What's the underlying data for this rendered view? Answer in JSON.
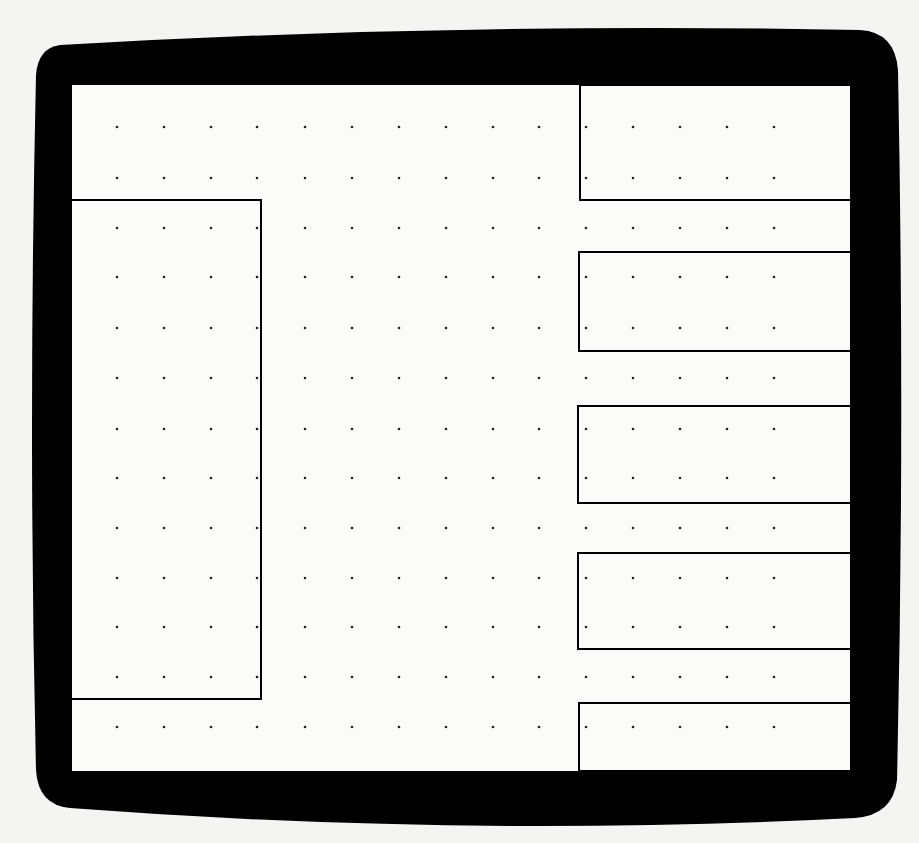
{
  "diagram": {
    "type": "dot-grid-with-rectangles",
    "frame": {
      "shape": "rounded-screen-bezel",
      "bezel_color": "#000000",
      "screen_color": "#fbfbf9",
      "background_color": "#f4f4f2",
      "screen_rect": {
        "x": 72,
        "y": 85,
        "w": 778,
        "h": 686
      }
    },
    "grid": {
      "dot_color": "#222222",
      "dot_radius": 1.3,
      "columns_x": [
        117,
        164,
        211,
        257,
        305,
        352,
        399,
        446,
        493,
        539,
        586,
        633,
        680,
        727,
        774
      ],
      "rows_y": [
        127,
        178,
        228,
        277,
        328,
        378,
        429,
        478,
        528,
        578,
        627,
        677,
        727
      ]
    },
    "rectangles": [
      {
        "name": "left-tall-rect",
        "x": 72,
        "y": 200,
        "w": 189,
        "h": 499,
        "open_side": "left"
      },
      {
        "name": "right-rect-1",
        "x": 580,
        "y": 85,
        "w": 270,
        "h": 115,
        "open_side": "right"
      },
      {
        "name": "right-rect-2",
        "x": 579,
        "y": 252,
        "w": 271,
        "h": 99,
        "open_side": "right"
      },
      {
        "name": "right-rect-3",
        "x": 578,
        "y": 406,
        "w": 272,
        "h": 97,
        "open_side": "right"
      },
      {
        "name": "right-rect-4",
        "x": 578,
        "y": 553,
        "w": 272,
        "h": 96,
        "open_side": "right"
      },
      {
        "name": "right-rect-5",
        "x": 579,
        "y": 703,
        "w": 271,
        "h": 68,
        "open_side": "right"
      }
    ],
    "line_color": "#000000",
    "line_width": 2
  }
}
